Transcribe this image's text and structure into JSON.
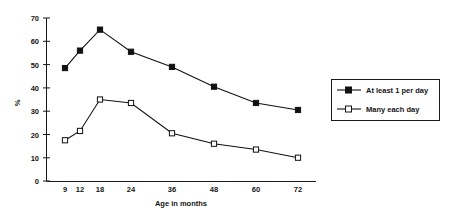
{
  "chart_data": {
    "type": "line",
    "title": "",
    "xlabel": "Age in months",
    "ylabel": "%",
    "x": [
      9,
      12,
      18,
      24,
      36,
      48,
      60,
      72
    ],
    "xtick_labels": [
      "9",
      "12",
      "18",
      "24",
      "36",
      "48",
      "60",
      "72"
    ],
    "ytick_labels": [
      "0",
      "10",
      "20",
      "30",
      "40",
      "50",
      "60",
      "70"
    ],
    "ytick_values": [
      0,
      10,
      20,
      30,
      40,
      50,
      60,
      70
    ],
    "ylim": [
      0,
      70
    ],
    "xlim": [
      9,
      72
    ],
    "grid": false,
    "legend_position": "right-outside",
    "series": [
      {
        "name": "At least 1 per day",
        "marker": "filled-square",
        "values": [
          48.5,
          56,
          65,
          55.5,
          49,
          40.5,
          33.5,
          30.5
        ]
      },
      {
        "name": "Many each day",
        "marker": "open-square",
        "values": [
          17.5,
          21.5,
          35,
          33.5,
          20.5,
          16,
          13.5,
          10
        ]
      }
    ],
    "colors": {
      "line": "#111111",
      "axis": "#1a1a1a",
      "background": "#ffffff"
    }
  },
  "legend": {
    "entries": [
      {
        "label": "At least 1 per day"
      },
      {
        "label": "Many each day"
      }
    ]
  },
  "axes": {
    "y_title": "%",
    "x_title": "Age in months"
  }
}
